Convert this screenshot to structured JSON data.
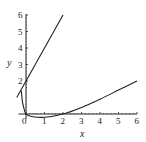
{
  "chart_data": {
    "type": "line",
    "title": "",
    "xlabel": "x",
    "ylabel": "y",
    "xlim": [
      -0.4,
      6
    ],
    "ylim": [
      -0.3,
      6
    ],
    "x_ticks": [
      "0",
      "1",
      "2",
      "3",
      "4",
      "5",
      "6"
    ],
    "y_ticks": [
      "2",
      "3",
      "4",
      "5",
      "6"
    ],
    "grid": false,
    "legend": null,
    "series": [
      {
        "name": "line",
        "points": [
          [
            -0.5,
            1.0
          ],
          [
            2.0,
            6.0
          ]
        ]
      },
      {
        "name": "curve",
        "points": [
          [
            -0.25,
            1.4
          ],
          [
            -0.2,
            0.8
          ],
          [
            -0.1,
            0.3
          ],
          [
            0,
            0
          ],
          [
            0.3,
            -0.15
          ],
          [
            1,
            -0.2
          ],
          [
            2,
            0
          ],
          [
            3,
            0.4
          ],
          [
            4,
            0.9
          ],
          [
            5,
            1.45
          ],
          [
            6,
            2.0
          ]
        ]
      }
    ]
  }
}
